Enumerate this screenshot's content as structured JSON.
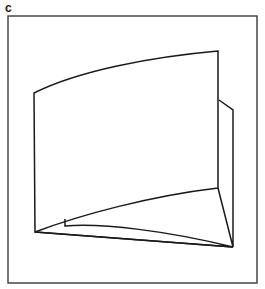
{
  "figure": {
    "panel_label": "c",
    "label_position": {
      "x": 5,
      "y": 0
    },
    "canvas": {
      "width": 265,
      "height": 289,
      "background": "#ffffff"
    },
    "frame": {
      "x": 8,
      "y": 16,
      "width": 249,
      "height": 267,
      "stroke": "#3a3a3a",
      "stroke_width": 1.4,
      "fill": "none"
    },
    "style": {
      "stroke": "#1a1a1a",
      "stroke_width": 1.5,
      "fill": "none",
      "line_join": "miter",
      "line_cap": "butt"
    },
    "shapes": [
      {
        "name": "main-panel",
        "role": "large curved front face of the sheet",
        "path": "M 34 93 C 78 71, 150 57, 218 51 L 218 188 C 150 196, 80 215, 35 232 Z",
        "vertices": [
          {
            "label": "top-left",
            "x": 34,
            "y": 93
          },
          {
            "label": "top-right",
            "x": 218,
            "y": 51
          },
          {
            "label": "bottom-right",
            "x": 218,
            "y": 188
          },
          {
            "label": "bottom-left",
            "x": 35,
            "y": 232
          }
        ]
      },
      {
        "name": "right-side-flap",
        "role": "narrow folded flap on the right edge receding in depth",
        "path": "M 219 100 L 233 110 L 233 247 L 218 188"
      },
      {
        "name": "bottom-wedge-flap",
        "role": "thin wedge-shaped flap along the lower edge",
        "path": "M 35 232 L 233 247 C 168 231, 103 223, 65 226 L 65 219"
      },
      {
        "name": "bottom-edge-connector",
        "role": "lower boundary line joining bottom-left corner to the far bottom-right convergence point",
        "path": "M 35 232 L 233 247"
      }
    ]
  }
}
